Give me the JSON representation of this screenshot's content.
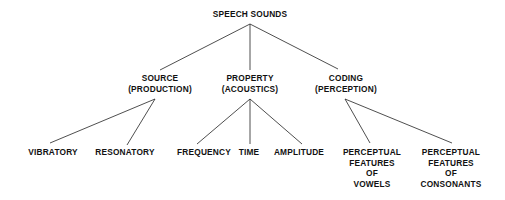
{
  "diagram": {
    "root": {
      "label": "SPEECH SOUNDS",
      "x": 250,
      "y": 9
    },
    "level1": [
      {
        "id": "source",
        "lines": [
          "SOURCE",
          "(PRODUCTION)"
        ],
        "x": 160,
        "y": 73
      },
      {
        "id": "property",
        "lines": [
          "PROPERTY",
          "(ACOUSTICS)"
        ],
        "x": 250,
        "y": 73
      },
      {
        "id": "coding",
        "lines": [
          "CODING",
          "(PERCEPTION)"
        ],
        "x": 346,
        "y": 73
      }
    ],
    "level2": [
      {
        "id": "vibratory",
        "parent": "source",
        "lines": [
          "VIBRATORY"
        ],
        "x": 53,
        "y": 147
      },
      {
        "id": "resonatory",
        "parent": "source",
        "lines": [
          "RESONATORY"
        ],
        "x": 125,
        "y": 147
      },
      {
        "id": "frequency",
        "parent": "property",
        "lines": [
          "FREQUENCY"
        ],
        "x": 204,
        "y": 147
      },
      {
        "id": "time",
        "parent": "property",
        "lines": [
          "TIME"
        ],
        "x": 249,
        "y": 147
      },
      {
        "id": "amplitude",
        "parent": "property",
        "lines": [
          "AMPLITUDE"
        ],
        "x": 299,
        "y": 147
      },
      {
        "id": "vowels",
        "parent": "coding",
        "lines": [
          "PERCEPTUAL",
          "FEATURES",
          "OF",
          "VOWELS"
        ],
        "x": 372,
        "y": 147
      },
      {
        "id": "consonants",
        "parent": "coding",
        "lines": [
          "PERCEPTUAL",
          "FEATURES",
          "OF",
          "CONSONANTS"
        ],
        "x": 451,
        "y": 147
      }
    ],
    "edges": [
      {
        "from": "root",
        "to": "source",
        "x1": 250,
        "y1": 24,
        "x2": 160,
        "y2": 70
      },
      {
        "from": "root",
        "to": "property",
        "x1": 250,
        "y1": 24,
        "x2": 250,
        "y2": 70
      },
      {
        "from": "root",
        "to": "coding",
        "x1": 250,
        "y1": 24,
        "x2": 338,
        "y2": 69
      },
      {
        "from": "source",
        "to": "vibratory",
        "x1": 155,
        "y1": 99,
        "x2": 50,
        "y2": 143
      },
      {
        "from": "source",
        "to": "resonatory",
        "x1": 155,
        "y1": 99,
        "x2": 127,
        "y2": 145
      },
      {
        "from": "property",
        "to": "frequency",
        "x1": 250,
        "y1": 99,
        "x2": 197,
        "y2": 144
      },
      {
        "from": "property",
        "to": "time",
        "x1": 250,
        "y1": 99,
        "x2": 250,
        "y2": 144
      },
      {
        "from": "property",
        "to": "amplitude",
        "x1": 250,
        "y1": 99,
        "x2": 302,
        "y2": 144
      },
      {
        "from": "coding",
        "to": "vowels",
        "x1": 345,
        "y1": 99,
        "x2": 370,
        "y2": 143
      },
      {
        "from": "coding",
        "to": "consonants",
        "x1": 345,
        "y1": 99,
        "x2": 452,
        "y2": 143
      }
    ]
  }
}
